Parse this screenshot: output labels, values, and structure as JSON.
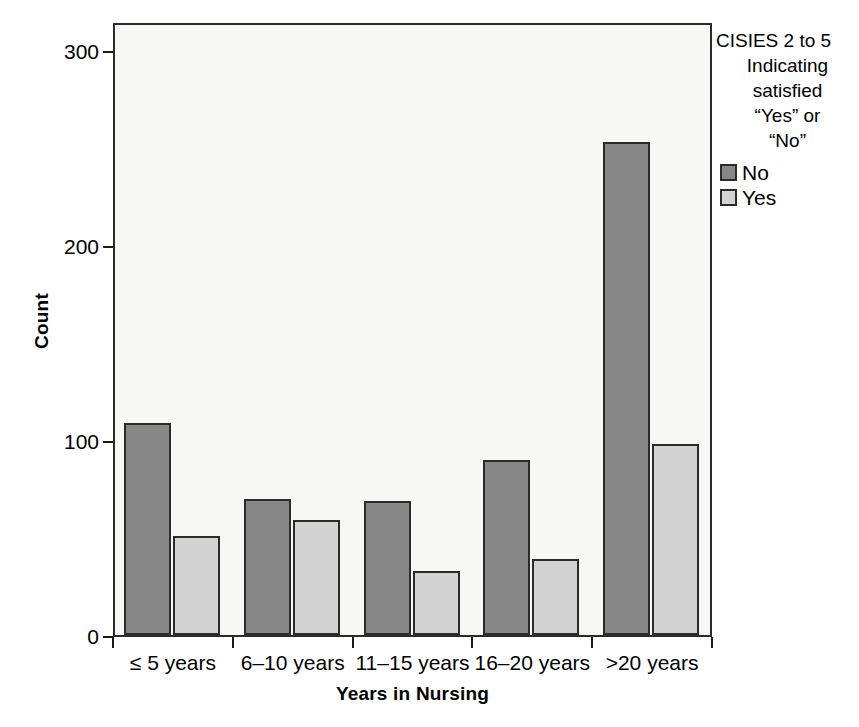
{
  "chart_data": {
    "type": "bar",
    "title": "",
    "xlabel": "Years in Nursing",
    "ylabel": "Count",
    "categories": [
      "≤ 5 years",
      "6–10 years",
      "11–15 years",
      "16–20 years",
      ">20 years"
    ],
    "series": [
      {
        "name": "No",
        "values": [
          109,
          70,
          69,
          90,
          253
        ],
        "color": "#878787"
      },
      {
        "name": "Yes",
        "values": [
          51,
          59,
          33,
          39,
          98
        ],
        "color": "#d3d3d3"
      }
    ],
    "ylim": [
      0,
      315
    ],
    "yticks": [
      0,
      100,
      200,
      300
    ],
    "ytick_labels": [
      "0",
      "100",
      "200",
      "300"
    ],
    "grid": false,
    "legend_position": "right",
    "legend": {
      "title_lines": [
        "CISIES 2 to 5",
        "Indicating",
        "satisfied",
        "“Yes” or",
        "“No”"
      ],
      "entries": [
        {
          "label": "No",
          "swatch": "series-no"
        },
        {
          "label": "Yes",
          "swatch": "series-yes"
        }
      ]
    },
    "axis_colors": {
      "line": "#2b2b2b",
      "plot_background": "#f7f7f5"
    }
  }
}
